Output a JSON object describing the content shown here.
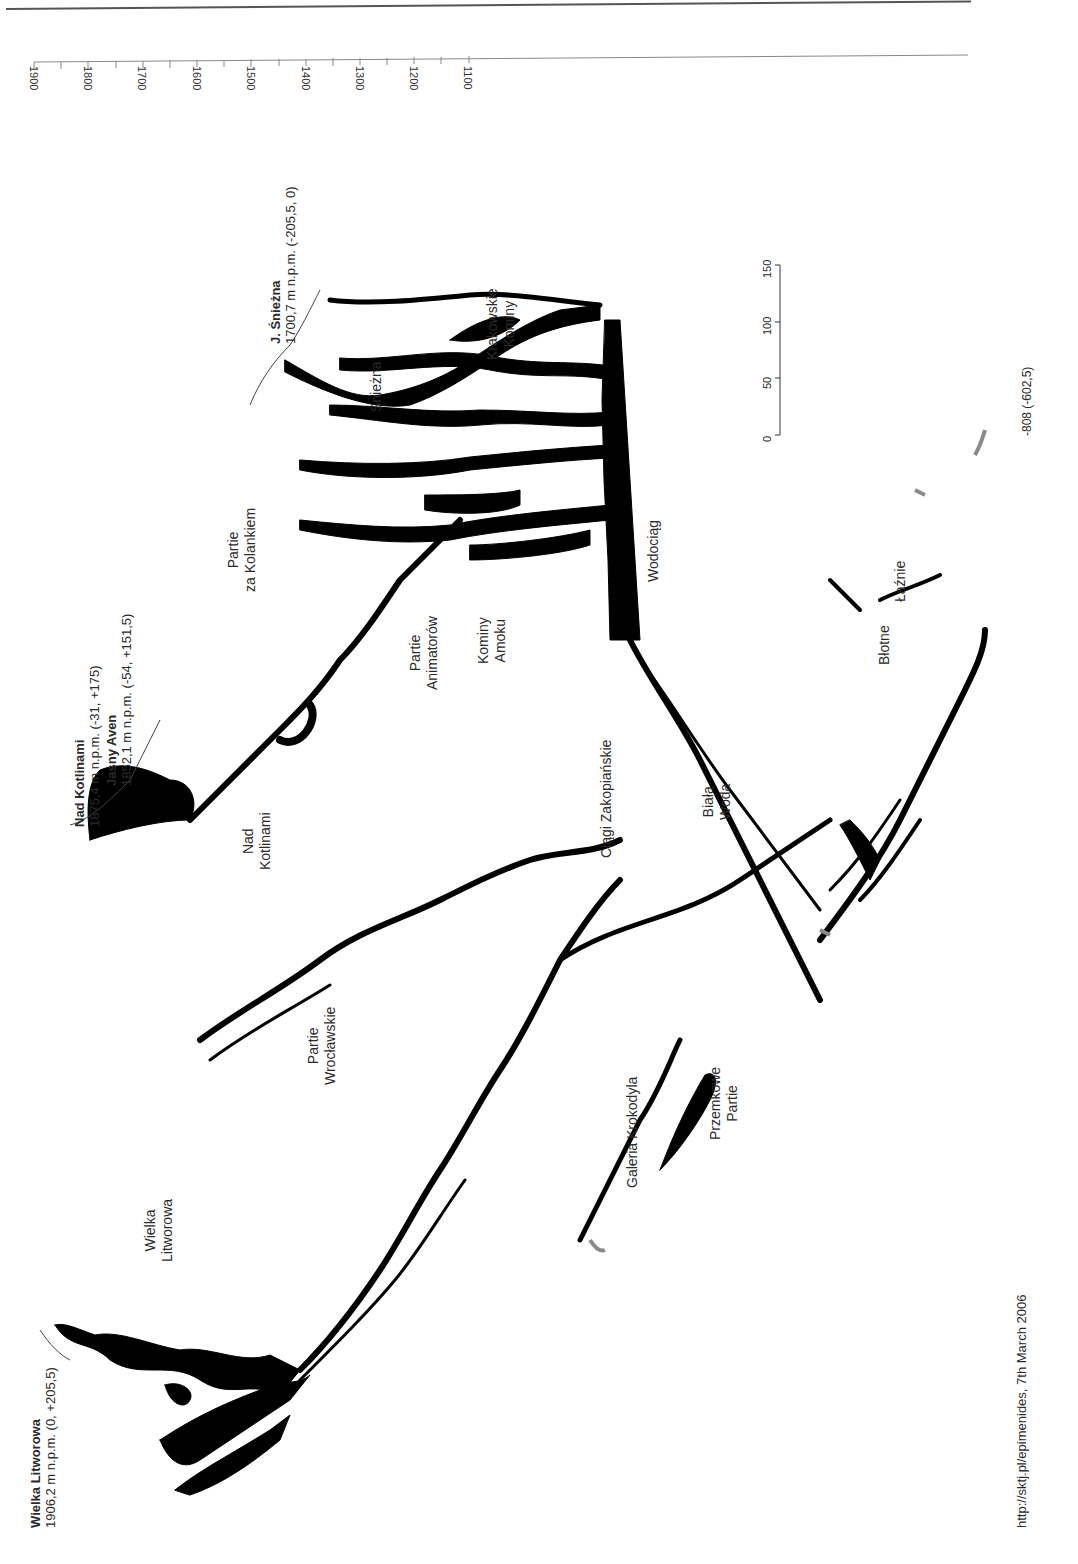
{
  "diagram": {
    "type": "cave-survey-profile",
    "orientation": "rotated-90",
    "altitude_axis": {
      "ticks": [
        "1900",
        "1800",
        "1700",
        "1600",
        "1500",
        "1400",
        "1300",
        "1200",
        "1100"
      ],
      "minor_ticks_between": 1
    },
    "scale_bar": {
      "ticks": [
        "0",
        "50",
        "100",
        "150"
      ]
    },
    "entrances": [
      {
        "name": "Wielka Litworowa",
        "detail": "1906,2 m n.p.m. (0, +205,5)"
      },
      {
        "name": "Nad Kotlinami",
        "detail": "1875,4 m n.p.m. (-31, +175)"
      },
      {
        "name": "Jasny Aven",
        "detail": "1852,1 m n.p.m. (-54, +151,5)"
      },
      {
        "name": "J. Śnieżna",
        "detail": "1700,7 m n.p.m. (-205,5, 0)"
      }
    ],
    "region_labels": [
      {
        "id": "wielka-litworowa",
        "lines": [
          "Wielka",
          "Litworowa"
        ]
      },
      {
        "id": "nad-kotlinami",
        "lines": [
          "Nad",
          "Kotlinami"
        ]
      },
      {
        "id": "partie-za-kolankiem",
        "lines": [
          "Partie",
          "za Kolankiem"
        ]
      },
      {
        "id": "sniezna",
        "lines": [
          "Śnieżna"
        ]
      },
      {
        "id": "krakowskie-kominy",
        "lines": [
          "Krakowskie",
          "Kominy"
        ]
      },
      {
        "id": "partie-animatorow",
        "lines": [
          "Partie",
          "Animatorów"
        ]
      },
      {
        "id": "kominy-amoku",
        "lines": [
          "Kominy",
          "Amoku"
        ]
      },
      {
        "id": "wodociag",
        "lines": [
          "Wodociąg"
        ]
      },
      {
        "id": "ciagi-zakopianskie",
        "lines": [
          "Ciągi Zakopiańskie"
        ]
      },
      {
        "id": "partie-wroclawskie",
        "lines": [
          "Partie",
          "Wrocławskie"
        ]
      },
      {
        "id": "biala-woda",
        "lines": [
          "Biała",
          "Woda"
        ]
      },
      {
        "id": "galeria-krokodyla",
        "lines": [
          "Galeria Krokodyla"
        ]
      },
      {
        "id": "przemkowe-partie",
        "lines": [
          "Przemkowe",
          "Partie"
        ]
      },
      {
        "id": "blotne",
        "lines": [
          "Błotne"
        ]
      },
      {
        "id": "laznie",
        "lines": [
          "Łaźnie"
        ]
      }
    ],
    "depth_note": "-808 (-602,5)",
    "footer": "http://sktj.pl/epimenides, 7th March 2006",
    "colors": {
      "cave": "#000000",
      "line": "#555555",
      "grey_passage": "#8a8a8a",
      "background": "#ffffff"
    }
  }
}
